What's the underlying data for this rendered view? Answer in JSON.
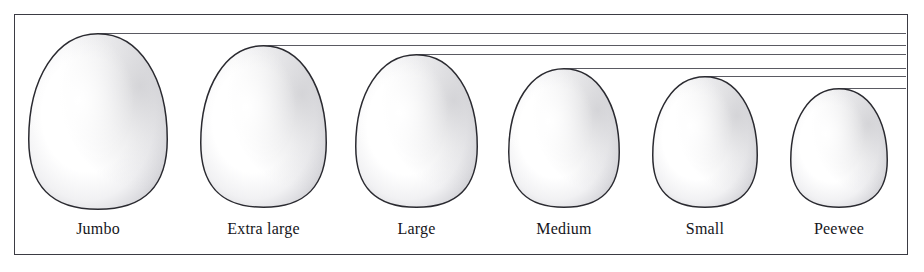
{
  "figure": {
    "background_color": "#ffffff",
    "frame": {
      "border_color": "#3b3b43",
      "fill_color": "#ffffff",
      "x": 14,
      "y": 14,
      "width": 894,
      "height": 241
    },
    "guide_line_color": "#5a5a62",
    "egg_outline_color": "#2a2a30",
    "egg_fill_color": "#ffffff",
    "egg_shade_color": "#c9c9cd",
    "label_color": "#15151a"
  },
  "chart_data": {
    "type": "bar",
    "xlabel": "",
    "ylabel": "Relative egg height (px)",
    "grid": true,
    "legend": "none",
    "categories": [
      "Jumbo",
      "Extra large",
      "Large",
      "Medium",
      "Small",
      "Peewee"
    ],
    "values": [
      177,
      163,
      154,
      140,
      132,
      120
    ],
    "ylim": [
      0,
      180
    ],
    "annotations": [
      "Horizontal guide line drawn at the apex of each egg extending to the right edge of the frame"
    ]
  },
  "eggs": [
    {
      "label": "Jumbo",
      "x": 28,
      "y": 33,
      "width": 140,
      "height": 177,
      "guide_y": 33,
      "label_x": 28,
      "label_y": 220,
      "label_width": 140
    },
    {
      "label": "Extra large",
      "x": 200,
      "y": 45,
      "width": 127,
      "height": 163,
      "guide_y": 45,
      "label_x": 190,
      "label_y": 220,
      "label_width": 147
    },
    {
      "label": "Large",
      "x": 355,
      "y": 54,
      "width": 123,
      "height": 154,
      "guide_y": 54,
      "label_x": 349,
      "label_y": 220,
      "label_width": 135
    },
    {
      "label": "Medium",
      "x": 508,
      "y": 68,
      "width": 112,
      "height": 140,
      "guide_y": 68,
      "label_x": 496,
      "label_y": 220,
      "label_width": 136
    },
    {
      "label": "Small",
      "x": 652,
      "y": 76,
      "width": 106,
      "height": 132,
      "guide_y": 76,
      "label_x": 642,
      "label_y": 220,
      "label_width": 126
    },
    {
      "label": "Peewee",
      "x": 790,
      "y": 88,
      "width": 98,
      "height": 120,
      "guide_y": 88,
      "label_x": 778,
      "label_y": 220,
      "label_width": 122
    }
  ]
}
